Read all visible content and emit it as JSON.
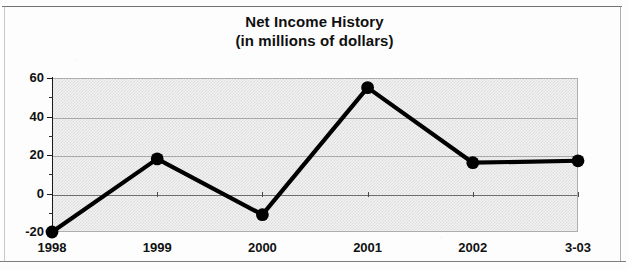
{
  "chart_data": {
    "type": "line",
    "title": "Net Income History",
    "subtitle": "(in millions of dollars)",
    "xlabel": "",
    "ylabel": "",
    "categories": [
      "1998",
      "1999",
      "2000",
      "2001",
      "2002",
      "3-03"
    ],
    "values": [
      -20,
      18,
      -11,
      55,
      16,
      17
    ],
    "series": [
      {
        "name": "Net Income",
        "values": [
          -20,
          18,
          -11,
          55,
          16,
          17
        ]
      }
    ],
    "ylim": [
      -20,
      60
    ],
    "ytick_labels": [
      "60",
      "40",
      "20",
      "0",
      "-20"
    ],
    "ytick_values": [
      60,
      40,
      20,
      0,
      -20
    ],
    "yminor_step": 10,
    "grid": true,
    "legend": "none",
    "marker": "filled-circle",
    "line_color": "#000000",
    "plot_background": "#e8e8e8",
    "gridline_color": "#9d9d9d",
    "axis_color": "#1a1a1a"
  }
}
